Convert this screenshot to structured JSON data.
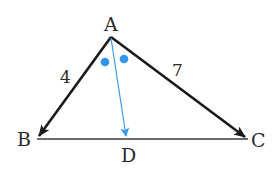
{
  "diagram": {
    "colors": {
      "stroke": "#1a1a1a",
      "bisector": "#3a9be8",
      "angle_mark": "#2e96ee",
      "background": "#ffffff"
    },
    "points": {
      "A": {
        "label": "A",
        "x": 111,
        "y": 37
      },
      "B": {
        "label": "B",
        "x": 37,
        "y": 139
      },
      "C": {
        "label": "C",
        "x": 248,
        "y": 139
      },
      "D": {
        "label": "D",
        "x": 127,
        "y": 139
      }
    },
    "sides": {
      "AB": {
        "label": "4"
      },
      "AC": {
        "label": "7"
      }
    },
    "segments": [
      {
        "from": "A",
        "to": "B",
        "style": "arrow",
        "color": "stroke"
      },
      {
        "from": "A",
        "to": "C",
        "style": "arrow",
        "color": "stroke"
      },
      {
        "from": "B",
        "to": "C",
        "style": "line",
        "color": "stroke"
      },
      {
        "from": "A",
        "to": "D",
        "style": "arrow",
        "color": "bisector"
      }
    ],
    "angle_marks": [
      {
        "type": "dot",
        "x": 105,
        "y": 62
      },
      {
        "type": "dot",
        "x": 124,
        "y": 59
      }
    ]
  }
}
